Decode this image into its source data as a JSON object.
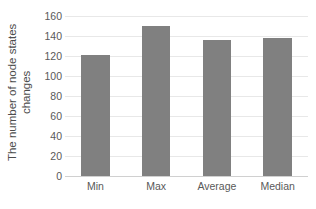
{
  "chart_data": {
    "type": "bar",
    "title": "",
    "subtitle": "",
    "xlabel": "",
    "ylabel": "The number of node states changes",
    "ylabel_lines": [
      "The number of node states",
      "changes"
    ],
    "categories": [
      "Min",
      "Max",
      "Average",
      "Median"
    ],
    "values": [
      121,
      150,
      136,
      138
    ],
    "series": [
      {
        "name": "The number of node states changes",
        "values": [
          121,
          150,
          136,
          138
        ]
      }
    ],
    "ylim": [
      0,
      160
    ],
    "y_ticks": [
      0,
      20,
      40,
      60,
      80,
      100,
      120,
      140,
      160
    ],
    "y_tick_labels": [
      "0",
      "20",
      "40",
      "60",
      "80",
      "100",
      "120",
      "140",
      "160"
    ],
    "grid": true,
    "grid_axis": "y",
    "legend": false,
    "legend_position": "none",
    "bar_color": "#808080",
    "gridline_color": "#e8e8e8",
    "background_color": "#ffffff",
    "text_color": "#595959",
    "annotations": []
  }
}
